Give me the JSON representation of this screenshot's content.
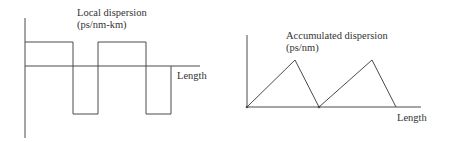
{
  "left_chart": {
    "title_line1": "Local dispersion",
    "title_line2": "(ps/nm-km)",
    "x_label": "Length"
  },
  "right_chart": {
    "title_line1": "Accumulated dispersion",
    "title_line2": "(ps/nm)",
    "x_label": "Length"
  },
  "colors": {
    "line": "#4a4a4a",
    "text": "#333333",
    "background": "#ffffff"
  }
}
